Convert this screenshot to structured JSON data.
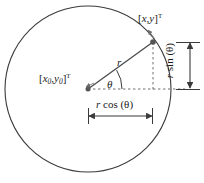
{
  "figure": {
    "background_color": "#ffffff",
    "stroke_color": "#3a3a3a",
    "dash_color": "#6e6e6e",
    "text_color": "#1a1a1a",
    "labels": {
      "point_on_circle": {
        "open_bracket": "[",
        "x": "x",
        "comma": ",",
        "y": "y",
        "close_bracket": "]",
        "transpose": "T"
      },
      "circle_center": {
        "open_bracket": "[",
        "x": "x",
        "x_sub": "0",
        "comma": ",",
        "y": "y",
        "y_sub": "0",
        "close_bracket": "]",
        "transpose": "T"
      },
      "radius": "r",
      "angle": "θ",
      "horizontal_leg": {
        "r": "r",
        "func": " cos (",
        "theta": "θ",
        "close": ")"
      },
      "vertical_leg": {
        "r": "r",
        "func": " sin (",
        "theta": "θ",
        "close": ")"
      }
    },
    "geometry": {
      "circle_center_px": {
        "x": 88,
        "y": 89
      },
      "circle_radius_px": 83,
      "point_on_circle_px": {
        "x": 153,
        "y": 42
      },
      "horizontal_dimension_y_px": 116,
      "vertical_dimension_x_px": 190,
      "angle_arc_radius_px": 34
    }
  }
}
